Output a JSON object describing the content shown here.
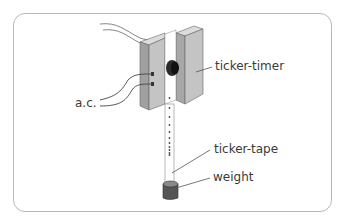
{
  "diagram": {
    "type": "apparatus",
    "labels": {
      "ticker_timer": "ticker-timer",
      "ac": "a.c.",
      "ticker_tape": "ticker-tape",
      "weight": "weight"
    },
    "colors": {
      "block_front": "#c4c4c4",
      "block_side": "#9a9a9a",
      "block_top": "#dcdcdc",
      "tape": "#ffffff",
      "outline": "#555555",
      "label_text": "#3a3a3a",
      "frame": "#b8b8b8"
    }
  }
}
